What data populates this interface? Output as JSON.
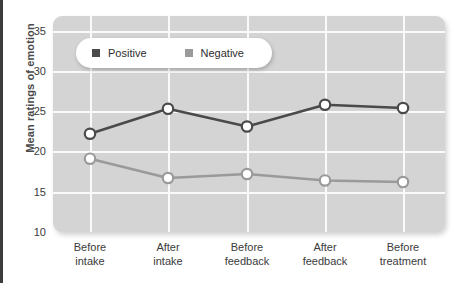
{
  "chart_data": {
    "type": "line",
    "title": "",
    "xlabel": "",
    "ylabel": "Mean ratings of emotion",
    "ylim": [
      10,
      35
    ],
    "yticks": [
      10,
      15,
      20,
      25,
      30,
      35
    ],
    "grid": true,
    "legend_position": "top-left-inside",
    "categories": [
      "Before intake",
      "After intake",
      "Before feedback",
      "After feedback",
      "Before treatment"
    ],
    "category_lines": [
      [
        "Before",
        "intake"
      ],
      [
        "After",
        "intake"
      ],
      [
        "Before",
        "feedback"
      ],
      [
        "After",
        "feedback"
      ],
      [
        "Before",
        "treatment"
      ]
    ],
    "series": [
      {
        "name": "Positive",
        "color": "#4a4a4a",
        "marker": "circle-open",
        "values": [
          22.2,
          25.3,
          23.1,
          25.8,
          25.4
        ]
      },
      {
        "name": "Negative",
        "color": "#9a9a9a",
        "marker": "circle-open",
        "values": [
          19.1,
          16.7,
          17.2,
          16.4,
          16.2
        ]
      }
    ]
  },
  "colors": {
    "panel_background": "#d4d4d4",
    "gridline": "#fafafa",
    "positive": "#4a4a4a",
    "negative": "#9a9a9a",
    "axis_text": "#3b3b3b",
    "axis_title": "#4a4a4a",
    "page_background": "#ffffff",
    "left_border": "#3d3d3d"
  },
  "legend": {
    "entries": [
      {
        "label": "Positive",
        "swatch_color": "#4a4a4a",
        "icon": "square-marker-icon"
      },
      {
        "label": "Negative",
        "swatch_color": "#9a9a9a",
        "icon": "square-marker-icon"
      }
    ]
  }
}
